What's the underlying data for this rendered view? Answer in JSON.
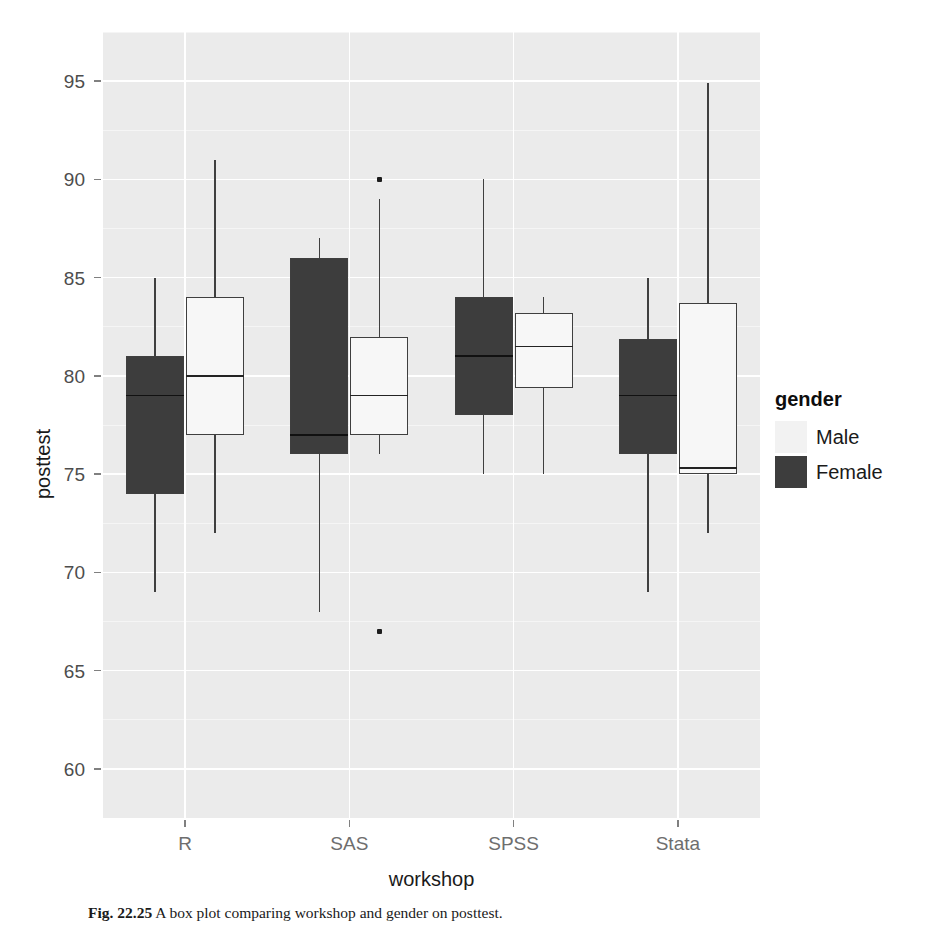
{
  "chart_data": {
    "type": "box",
    "title": "",
    "xlabel": "workshop",
    "ylabel": "posttest",
    "categories": [
      "R",
      "SAS",
      "SPSS",
      "Stata"
    ],
    "ylim": [
      57.5,
      97.5
    ],
    "yticks": [
      60,
      65,
      70,
      75,
      80,
      85,
      90,
      95
    ],
    "ytick_labels": [
      "60",
      "65",
      "70",
      "75",
      "80",
      "85",
      "90",
      "95"
    ],
    "grid": true,
    "legend": {
      "title": "gender",
      "position": "right",
      "entries": [
        {
          "label": "Male",
          "color": "#f2f2f2"
        },
        {
          "label": "Female",
          "color": "#3d3d3d"
        }
      ]
    },
    "series": [
      {
        "name": "Female",
        "fill": "#3d3d3d",
        "boxes": [
          {
            "category": "R",
            "lower_whisker": 69.0,
            "q1": 74.0,
            "median": 79.0,
            "q3": 81.0,
            "upper_whisker": 85.0,
            "outliers": []
          },
          {
            "category": "SAS",
            "lower_whisker": 68.0,
            "q1": 76.0,
            "median": 77.0,
            "q3": 86.0,
            "upper_whisker": 87.0,
            "outliers": []
          },
          {
            "category": "SPSS",
            "lower_whisker": 75.0,
            "q1": 78.0,
            "median": 81.0,
            "q3": 84.0,
            "upper_whisker": 90.0,
            "outliers": []
          },
          {
            "category": "Stata",
            "lower_whisker": 69.0,
            "q1": 76.0,
            "median": 79.0,
            "q3": 81.9,
            "upper_whisker": 85.0,
            "outliers": []
          }
        ]
      },
      {
        "name": "Male",
        "fill": "#f7f7f7",
        "boxes": [
          {
            "category": "R",
            "lower_whisker": 72.0,
            "q1": 77.0,
            "median": 80.0,
            "q3": 84.0,
            "upper_whisker": 91.0,
            "outliers": []
          },
          {
            "category": "SAS",
            "lower_whisker": 76.0,
            "q1": 77.0,
            "median": 79.0,
            "q3": 82.0,
            "upper_whisker": 89.0,
            "outliers": [
              90.0,
              67.0
            ]
          },
          {
            "category": "SPSS",
            "lower_whisker": 75.0,
            "q1": 79.4,
            "median": 81.5,
            "q3": 83.2,
            "upper_whisker": 84.0,
            "outliers": []
          },
          {
            "category": "Stata",
            "lower_whisker": 72.0,
            "q1": 75.0,
            "median": 75.3,
            "q3": 83.7,
            "upper_whisker": 94.9,
            "outliers": []
          }
        ]
      }
    ]
  },
  "caption": {
    "figure_number": "Fig. 22.25",
    "text": "A box plot comparing workshop and gender on posttest."
  }
}
